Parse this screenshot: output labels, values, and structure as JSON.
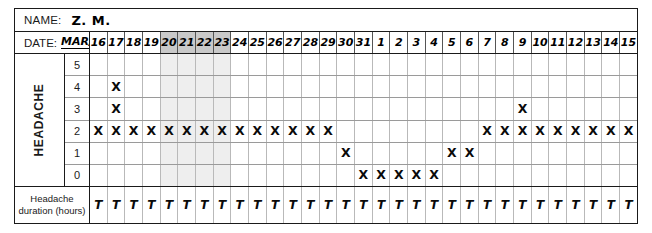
{
  "header": {
    "name_label": "NAME:",
    "name_value": "Z. M.",
    "date_label": "DATE:",
    "month_value": "MAR/APR"
  },
  "axis": {
    "vertical_label": "HEADACHE",
    "duration_label_line1": "Headache",
    "duration_label_line2": "duration (hours)",
    "severity_levels": [
      "5",
      "4",
      "3",
      "2",
      "1",
      "0"
    ]
  },
  "marks": {
    "x_glyph": "X",
    "duration_glyph": "T"
  },
  "colors": {
    "border": "#1a1a1a",
    "gridline": "#b9b9b9",
    "row_line": "#9a9a9a",
    "shaded_header": "#c9c9c9",
    "shaded_cell": "#eeeeee",
    "mark": "#0a0a0a"
  },
  "chart_data": {
    "type": "heatmap",
    "xlabel": "DATE: MAR/APR",
    "ylabel": "HEADACHE",
    "categories": [
      "16",
      "17",
      "18",
      "19",
      "20",
      "21",
      "22",
      "23",
      "24",
      "25",
      "26",
      "27",
      "28",
      "29",
      "30",
      "31",
      "1",
      "2",
      "3",
      "4",
      "5",
      "6",
      "7",
      "8",
      "9",
      "10",
      "11",
      "12",
      "13",
      "14",
      "15"
    ],
    "y_levels": [
      "5",
      "4",
      "3",
      "2",
      "1",
      "0"
    ],
    "ylim": [
      0,
      5
    ],
    "grid": true,
    "legend": "none",
    "highlighted_dates": [
      "20",
      "21",
      "22",
      "23"
    ],
    "severity_by_date": {
      "16": 2,
      "17": 4,
      "18": 2,
      "19": 2,
      "20": 2,
      "21": 2,
      "22": 2,
      "23": 2,
      "24": 2,
      "25": 2,
      "26": 2,
      "27": 2,
      "28": 2,
      "29": 2,
      "30": 1,
      "31": 0,
      "1": 0,
      "2": 0,
      "3": 0,
      "4": 0,
      "5": 1,
      "6": 1,
      "7": 2,
      "8": 2,
      "9": 3,
      "10": 2,
      "11": 2,
      "12": 2,
      "13": 2,
      "14": 2,
      "15": 2
    },
    "marked_cells": [
      {
        "level": 4,
        "dates": [
          "17"
        ]
      },
      {
        "level": 3,
        "dates": [
          "17",
          "9"
        ]
      },
      {
        "level": 2,
        "dates": [
          "16",
          "17",
          "18",
          "19",
          "20",
          "21",
          "22",
          "23",
          "24",
          "25",
          "26",
          "27",
          "28",
          "29",
          "7",
          "8",
          "9",
          "10",
          "11",
          "12",
          "13",
          "14",
          "15"
        ]
      },
      {
        "level": 1,
        "dates": [
          "30",
          "5",
          "6"
        ]
      },
      {
        "level": 0,
        "dates": [
          "31",
          "1",
          "2",
          "3",
          "4"
        ]
      }
    ],
    "duration_marks": [
      "16",
      "17",
      "18",
      "19",
      "20",
      "21",
      "22",
      "23",
      "24",
      "25",
      "26",
      "27",
      "28",
      "29",
      "30",
      "31",
      "1",
      "2",
      "3",
      "4",
      "5",
      "6",
      "7",
      "8",
      "9",
      "10",
      "11",
      "12",
      "13",
      "14",
      "15"
    ]
  }
}
